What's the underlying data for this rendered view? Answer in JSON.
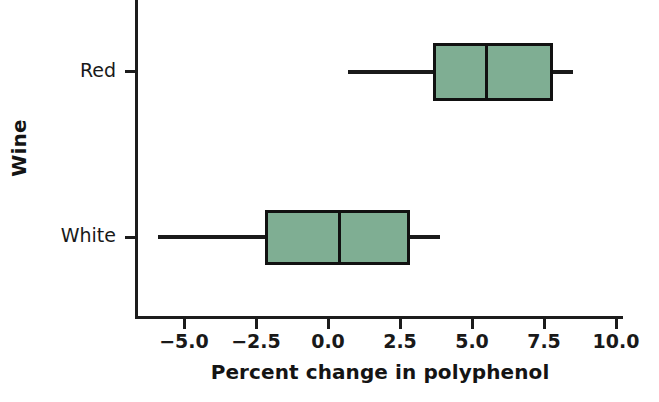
{
  "chart_data": {
    "type": "box",
    "title": "",
    "xlabel": "Percent change in polyphenol",
    "ylabel": "Wine",
    "xlim": [
      -6.8,
      10.2
    ],
    "xticks": [
      "-5.0",
      "-2.5",
      "0.0",
      "2.5",
      "5.0",
      "7.5",
      "10.0"
    ],
    "xtick_values": [
      -5.0,
      -2.5,
      0.0,
      2.5,
      5.0,
      7.5,
      10.0
    ],
    "categories": [
      "Red",
      "White"
    ],
    "grid": false,
    "legend": false,
    "orientation": "horizontal",
    "boxes": [
      {
        "category": "Red",
        "whisker_low": 0.7,
        "q1": 3.65,
        "median": 5.5,
        "q3": 7.8,
        "whisker_high": 8.5,
        "fill": "#7FAE93"
      },
      {
        "category": "White",
        "whisker_low": -5.9,
        "q1": -2.2,
        "median": 0.4,
        "q3": 2.85,
        "whisker_high": 3.9,
        "fill": "#7FAE93"
      }
    ]
  },
  "style": {
    "box_fill": "#7FAE93",
    "line_color": "#111111",
    "axis_color": "#1c1c1c",
    "background": "#ffffff"
  }
}
